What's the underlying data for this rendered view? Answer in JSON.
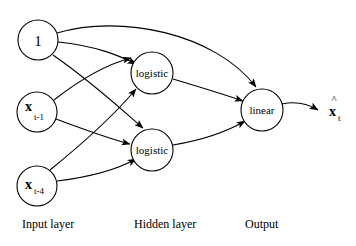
{
  "diagram": {
    "background_color": "#ffffff",
    "stroke_color": "#000000",
    "layers": [
      {
        "id": "input",
        "label": "Input layer",
        "label_x": 22,
        "label_y": 228
      },
      {
        "id": "hidden",
        "label": "Hidden layer",
        "label_x": 134,
        "label_y": 228
      },
      {
        "id": "output",
        "label": "Output",
        "label_x": 245,
        "label_y": 228
      }
    ],
    "nodes": [
      {
        "id": "bias",
        "layer": "input",
        "label": "1",
        "sub": "",
        "cx": 38,
        "cy": 40,
        "r": 20
      },
      {
        "id": "x_t1",
        "layer": "input",
        "label": "x",
        "sub": "t-1",
        "cx": 37,
        "cy": 112,
        "r": 20
      },
      {
        "id": "x_t4",
        "layer": "input",
        "label": "x",
        "sub": "t-4",
        "cx": 37,
        "cy": 186,
        "r": 20
      },
      {
        "id": "logistic1",
        "layer": "hidden",
        "label": "logistic",
        "sub": "",
        "cx": 152,
        "cy": 73,
        "r": 21
      },
      {
        "id": "logistic2",
        "layer": "hidden",
        "label": "logistic",
        "sub": "",
        "cx": 152,
        "cy": 150,
        "r": 21
      },
      {
        "id": "linear",
        "layer": "output",
        "label": "linear",
        "sub": "",
        "cx": 262,
        "cy": 110,
        "r": 21
      }
    ],
    "edges": [
      {
        "id": "bias-to-linear",
        "from": "bias",
        "to": "linear"
      },
      {
        "id": "bias-to-logistic1",
        "from": "bias",
        "to": "logistic1"
      },
      {
        "id": "bias-to-logistic2",
        "from": "bias",
        "to": "logistic2"
      },
      {
        "id": "xt1-to-logistic1",
        "from": "x_t1",
        "to": "logistic1"
      },
      {
        "id": "xt1-to-logistic2",
        "from": "x_t1",
        "to": "logistic2"
      },
      {
        "id": "xt4-to-logistic1",
        "from": "x_t4",
        "to": "logistic1"
      },
      {
        "id": "xt4-to-logistic2",
        "from": "x_t4",
        "to": "logistic2"
      },
      {
        "id": "logistic1-to-linear",
        "from": "logistic1",
        "to": "linear"
      },
      {
        "id": "logistic2-to-linear",
        "from": "logistic2",
        "to": "linear"
      },
      {
        "id": "linear-to-output",
        "from": "linear",
        "to": "output"
      }
    ],
    "output_value": {
      "main": "x",
      "hat": "^",
      "sub": "t",
      "x": 330,
      "y": 110
    }
  }
}
